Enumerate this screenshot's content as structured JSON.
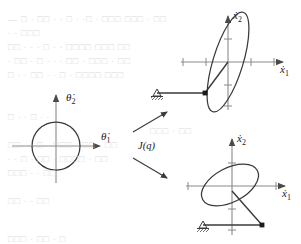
{
  "figure": {
    "name": "manipulability-ellipsoid-diagram",
    "stroke_color": "#3a3a3a",
    "axis_color": "#8a8a8a",
    "background": "#ffffff",
    "bleed_color": "#d9d9d6",
    "mapping_label": "J(q)",
    "plots": {
      "joint_velocity": {
        "name": "joint-velocity-space",
        "x_axis_label": "θ̇",
        "x_axis_sub": "1",
        "y_axis_label": "θ̇",
        "y_axis_sub": "2",
        "shape": "circle",
        "center": [
          56,
          146
        ],
        "radius": 24
      },
      "task_velocity_top": {
        "name": "task-velocity-space-configuration-1",
        "x_axis_label": "ẋ",
        "x_axis_sub": "1",
        "y_axis_label": "ẋ",
        "y_axis_sub": "2",
        "shape": "ellipse",
        "center": [
          228,
          62
        ],
        "semi_major": 52,
        "semi_minor": 15,
        "rotation_deg": -73,
        "arm": {
          "base": [
            156,
            93
          ],
          "joint": [
            205,
            93
          ],
          "tip": [
            228,
            62
          ]
        }
      },
      "task_velocity_bottom": {
        "name": "task-velocity-space-configuration-2",
        "x_axis_label": "ẋ",
        "x_axis_sub": "1",
        "y_axis_label": "ẋ",
        "y_axis_sub": "2",
        "shape": "ellipse",
        "center": [
          230,
          185
        ],
        "semi_major": 31,
        "semi_minor": 17,
        "rotation_deg": -28,
        "arm": {
          "base": [
            202,
            225
          ],
          "joint": [
            262,
            225
          ],
          "tip": [
            232,
            192
          ]
        }
      }
    },
    "arrows": {
      "upper_arrow_label": "map-to-configuration-1",
      "lower_arrow_label": "map-to-configuration-2"
    }
  },
  "bleed_text": {
    "note": "faint show-through text from reverse of scanned page",
    "lines": [
      {
        "x": 8,
        "y": 14,
        "text": "— □ ∙ □□ ∙ ∙ □ ∙ ∙□ ∙ □□□ □□□ ∙ □□"
      },
      {
        "x": 8,
        "y": 28,
        "text": "∙ ∙ □□□"
      },
      {
        "x": 8,
        "y": 42,
        "text": "□□ ∙ ∙ ∙ □ ∙ ∙ □□□□ □□□ □□"
      },
      {
        "x": 8,
        "y": 56,
        "text": "∙ □□ ∙ □ ∙ ∙ ∙ □□ ∙ □□□ ∙ □□"
      },
      {
        "x": 8,
        "y": 70,
        "text": "□ ∙ ∙ □□ ∙ ∙ □ ∙ □□□□ □□□"
      },
      {
        "x": 8,
        "y": 112,
        "text": "□ ∙ ∙ □ ∙ ∙"
      },
      {
        "x": 150,
        "y": 126,
        "text": "□□□ ∙ □□"
      },
      {
        "x": 8,
        "y": 140,
        "text": "□□ ∙ ∙ □ ∙ □□□ ∙ □□ ∙ □□"
      },
      {
        "x": 8,
        "y": 154,
        "text": "∙ ∙ □ ∙ □□ ∙ □□□□ ∙ □□"
      },
      {
        "x": 8,
        "y": 168,
        "text": "□□□ ∙ ∙ □□"
      },
      {
        "x": 8,
        "y": 196,
        "text": "□□ ∙ ∙ □□"
      },
      {
        "x": 8,
        "y": 234,
        "text": "□□□ ∙ □□ ∙ □"
      }
    ]
  }
}
